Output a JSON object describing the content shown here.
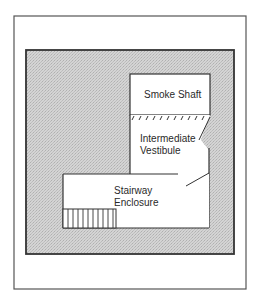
{
  "diagram": {
    "type": "floor-plan",
    "rooms": [
      {
        "id": "smoke-shaft",
        "label": "Smoke Shaft"
      },
      {
        "id": "intermediate-vestibule",
        "label_line1": "Intermediate",
        "label_line2": "Vestibule"
      },
      {
        "id": "stairway-enclosure",
        "label_line1": "Stairway",
        "label_line2": "Enclosure"
      }
    ],
    "colors": {
      "frame": "#555555",
      "wall": "#3a3a3a",
      "shade": "#c8c8c8",
      "room_fill": "#ffffff"
    }
  }
}
